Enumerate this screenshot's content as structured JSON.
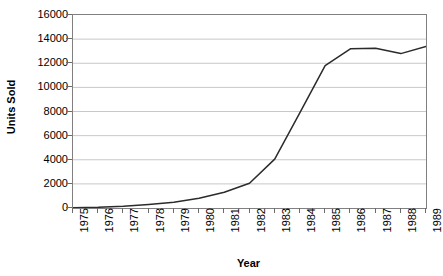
{
  "chart_data": {
    "type": "line",
    "title": "",
    "xlabel": "Year",
    "ylabel": "Units Sold",
    "categories": [
      "1975",
      "1976",
      "1977",
      "1978",
      "1979",
      "1980",
      "1981",
      "1982",
      "1983",
      "1984",
      "1985",
      "1986",
      "1987",
      "1988",
      "1989"
    ],
    "values": [
      20,
      60,
      150,
      300,
      480,
      800,
      1300,
      2050,
      4050,
      7900,
      11800,
      13200,
      13250,
      12800,
      13400
    ],
    "series": [
      {
        "name": "Units Sold",
        "values": [
          20,
          60,
          150,
          300,
          480,
          800,
          1300,
          2050,
          4050,
          7900,
          11800,
          13200,
          13250,
          12800,
          13400
        ],
        "color": "#2b2b2b"
      }
    ],
    "ylim": [
      0,
      16000
    ],
    "yticks": [
      0,
      2000,
      4000,
      6000,
      8000,
      10000,
      12000,
      14000,
      16000
    ],
    "ytick_labels": [
      "0",
      "2000",
      "4000",
      "6000",
      "8000",
      "10000",
      "12000",
      "14000",
      "16000"
    ],
    "grid": "horizontal",
    "gridcolor": "#c8c8c8",
    "legend": "none",
    "plot_border_color": "#808080",
    "background": "#ffffff"
  }
}
